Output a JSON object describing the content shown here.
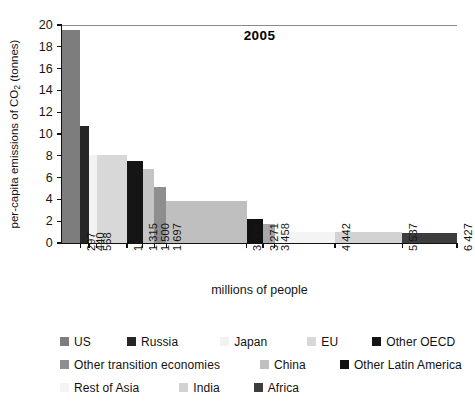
{
  "chart_data": {
    "type": "bar",
    "variant": "marimekko-variable-width",
    "title": "2005",
    "xlabel": "millions of people",
    "ylabel": "per-capita emissions of CO2 (tonnes)",
    "ylabel_parts": {
      "pre": "per-capita emissions of CO",
      "sub": "2",
      "post": " (tonnes)"
    },
    "ylim": [
      0,
      20
    ],
    "yticks": [
      0,
      2,
      4,
      6,
      8,
      10,
      12,
      14,
      16,
      18,
      20
    ],
    "ytick_labels": [
      "0",
      "2",
      "4",
      "6",
      "8",
      "10",
      "12",
      "14",
      "16",
      "18",
      "20"
    ],
    "xlim": [
      0,
      6427
    ],
    "xticks": [
      297,
      440,
      568,
      1059,
      1315,
      1500,
      1697,
      3008,
      3271,
      3458,
      4442,
      5537,
      6427
    ],
    "xtick_labels": [
      "297",
      "440",
      "568",
      "1 059",
      "1 315",
      "1 500",
      "1 697",
      "3 008",
      "3 271",
      "3 458",
      "4 442",
      "5 537",
      "6 427"
    ],
    "grid": false,
    "legend_position": "below",
    "x_axis_meaning": "cumulative population (millions of people)",
    "y_axis_meaning": "per-capita CO2 emissions (tonnes)",
    "categories": [
      "US",
      "Russia",
      "Japan",
      "EU",
      "Other OECD",
      "Middle East",
      "Other transition economies",
      "China",
      "Other Latin America",
      "Brazil",
      "Rest of Asia",
      "India",
      "Africa"
    ],
    "values": [
      19.5,
      10.7,
      8.05,
      8.05,
      7.5,
      6.75,
      5.15,
      3.9,
      2.2,
      1.75,
      1.0,
      1.0,
      0.95
    ],
    "bars": [
      {
        "name": "US",
        "value": 19.5,
        "x_start": 0,
        "x_end": 297,
        "width": 297,
        "color": "#7d7d7d"
      },
      {
        "name": "Russia",
        "value": 10.7,
        "x_start": 297,
        "x_end": 440,
        "width": 143,
        "color": "#262626"
      },
      {
        "name": "Japan",
        "value": 8.05,
        "x_start": 440,
        "x_end": 568,
        "width": 128,
        "color": "#f2f2f2"
      },
      {
        "name": "EU",
        "value": 8.05,
        "x_start": 568,
        "x_end": 1059,
        "width": 491,
        "color": "#d8d8d8"
      },
      {
        "name": "Other OECD",
        "value": 7.5,
        "x_start": 1059,
        "x_end": 1315,
        "width": 256,
        "color": "#151515"
      },
      {
        "name": "Middle East",
        "value": 6.75,
        "x_start": 1315,
        "x_end": 1500,
        "width": 185,
        "color": "#c4c4c4"
      },
      {
        "name": "Other transition economies",
        "value": 5.15,
        "x_start": 1500,
        "x_end": 1697,
        "width": 197,
        "color": "#8e8e8e"
      },
      {
        "name": "China",
        "value": 3.9,
        "x_start": 1697,
        "x_end": 3008,
        "width": 1311,
        "color": "#bfbfbf"
      },
      {
        "name": "Other Latin America",
        "value": 2.2,
        "x_start": 3008,
        "x_end": 3271,
        "width": 263,
        "color": "#111111"
      },
      {
        "name": "Brazil",
        "value": 1.75,
        "x_start": 3271,
        "x_end": 3458,
        "width": 187,
        "color": "#a8a8a8"
      },
      {
        "name": "Rest of Asia",
        "value": 1.0,
        "x_start": 3458,
        "x_end": 4442,
        "width": 984,
        "color": "#f4f4f4"
      },
      {
        "name": "India",
        "value": 1.0,
        "x_start": 4442,
        "x_end": 5537,
        "width": 1095,
        "color": "#d2d2d2"
      },
      {
        "name": "Africa",
        "value": 0.95,
        "x_start": 5537,
        "x_end": 6427,
        "width": 890,
        "color": "#3d3d3d"
      }
    ],
    "legend": [
      [
        {
          "label": "US",
          "color": "#7d7d7d"
        },
        {
          "label": "Russia",
          "color": "#262626"
        },
        {
          "label": "Japan",
          "color": "#f2f2f2"
        },
        {
          "label": "EU",
          "color": "#d8d8d8"
        },
        {
          "label": "Other OECD",
          "color": "#151515"
        },
        {
          "label": "Middle East",
          "color": "#c4c4c4"
        }
      ],
      [
        {
          "label": "Other transition economies",
          "color": "#8e8e8e"
        },
        {
          "label": "China",
          "color": "#bfbfbf"
        },
        {
          "label": "Other Latin America",
          "color": "#111111"
        },
        {
          "label": "Brazil",
          "color": "#a8a8a8"
        }
      ],
      [
        {
          "label": "Rest of Asia",
          "color": "#f4f4f4"
        },
        {
          "label": "India",
          "color": "#d2d2d2"
        },
        {
          "label": "Africa",
          "color": "#3d3d3d"
        }
      ]
    ]
  }
}
